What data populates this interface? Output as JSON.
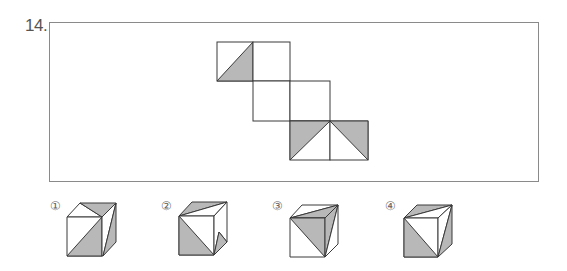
{
  "question": {
    "number": "14.",
    "colors": {
      "shade": "#b8b8b8",
      "line": "#3a3a3a",
      "frame": "#8a8a8a",
      "face": "#ffffff"
    }
  },
  "net": {
    "description": "Cube net of six squares in a staircase; two top squares, two middle squares, two bottom squares",
    "faces": [
      {
        "position": "top-left",
        "pattern": "lower-right triangle shaded"
      },
      {
        "position": "top-right",
        "pattern": "blank"
      },
      {
        "position": "middle-left",
        "pattern": "blank"
      },
      {
        "position": "middle-right",
        "pattern": "blank"
      },
      {
        "position": "bottom-left",
        "pattern": "upper-left triangle shaded"
      },
      {
        "position": "bottom-right",
        "pattern": "upper-right triangle shaded"
      }
    ]
  },
  "options": [
    {
      "label": "①",
      "value": 1
    },
    {
      "label": "②",
      "value": 2
    },
    {
      "label": "③",
      "value": 3
    },
    {
      "label": "④",
      "value": 4
    }
  ]
}
